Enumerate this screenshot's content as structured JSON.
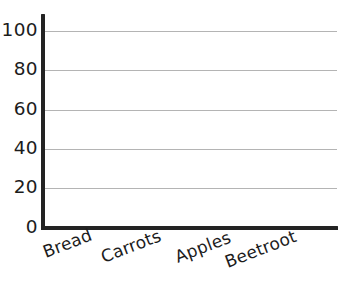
{
  "chart_data": {
    "type": "bar",
    "title": "",
    "subtitle": "",
    "xlabel": "",
    "ylabel": "",
    "categories": [
      "Bread",
      "Carrots",
      "Apples",
      "Beetroot"
    ],
    "values": [
      null,
      null,
      null,
      null
    ],
    "series": [
      {
        "name": "",
        "values": [
          null,
          null,
          null,
          null
        ]
      }
    ],
    "ylim": [
      0,
      100
    ],
    "yticks": [
      0,
      20,
      40,
      60,
      80,
      100
    ],
    "ytick_labels": [
      "0",
      "20",
      "40",
      "60",
      "80",
      "100"
    ],
    "xtick_labels": [
      "Bread",
      "Carrots",
      "Apples",
      "Beetroot"
    ],
    "grid": true,
    "grid_axis": "y",
    "legend": false,
    "legend_position": "none",
    "annotations": [],
    "colors": {
      "axis": "#232323",
      "gridline": "#b4b4b4",
      "text": "#1c1c1c",
      "background": "#ffffff"
    },
    "xtick_rotation_deg": -21
  },
  "axes": {
    "y_ticks": [
      {
        "label": "100",
        "value": 100,
        "top": 31
      },
      {
        "label": "80",
        "value": 80,
        "top": 70
      },
      {
        "label": "60",
        "value": 60,
        "top": 110
      },
      {
        "label": "40",
        "value": 40,
        "top": 149
      },
      {
        "label": "20",
        "value": 20,
        "top": 188
      },
      {
        "label": "0",
        "value": 0,
        "top": 228
      }
    ],
    "x_ticks": [
      {
        "label": "Bread",
        "left": 40,
        "top": 243
      },
      {
        "label": "Carrots",
        "left": 98,
        "top": 248
      },
      {
        "label": "Apples",
        "left": 172,
        "top": 248
      },
      {
        "label": "Beetroot",
        "left": 222,
        "top": 253
      }
    ]
  }
}
